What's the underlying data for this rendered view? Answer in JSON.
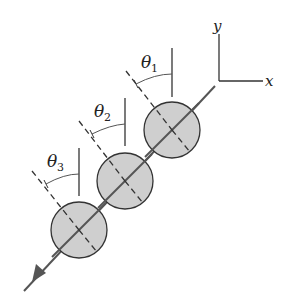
{
  "figure": {
    "axes": {
      "x_label": "x",
      "y_label": "y"
    },
    "angles": [
      {
        "symbol": "θ",
        "subscript": "1"
      },
      {
        "symbol": "θ",
        "subscript": "2"
      },
      {
        "symbol": "θ",
        "subscript": "3"
      }
    ],
    "colors": {
      "disk_fill": "#cfcfcf",
      "line": "#555555",
      "stroke": "#333333"
    }
  }
}
